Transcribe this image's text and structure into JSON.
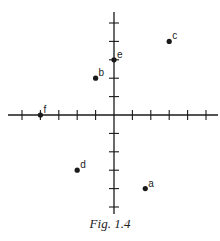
{
  "figure": {
    "caption": "Fig. 1.4"
  },
  "chart_data": {
    "type": "scatter",
    "title": "",
    "xlabel": "",
    "ylabel": "",
    "xlim": [
      -5,
      5
    ],
    "ylim": [
      -5,
      5
    ],
    "grid": false,
    "axes": "cross-at-origin with unit tick marks, no tick labels",
    "points": [
      {
        "label": "a",
        "x": 1.7,
        "y": -4
      },
      {
        "label": "b",
        "x": -1,
        "y": 2
      },
      {
        "label": "c",
        "x": 3,
        "y": 4
      },
      {
        "label": "d",
        "x": -2,
        "y": -3
      },
      {
        "label": "e",
        "x": 0,
        "y": 3
      },
      {
        "label": "f",
        "x": -4,
        "y": 0
      }
    ],
    "caption": "Fig. 1.4"
  },
  "layout": {
    "origin_px": [
      114,
      115
    ],
    "unit_px": 18.4,
    "x_axis_px": [
      8,
      218
    ],
    "y_axis_px": [
      12,
      214
    ],
    "tick_half_len": 5,
    "ink": "#1a1a1a"
  }
}
